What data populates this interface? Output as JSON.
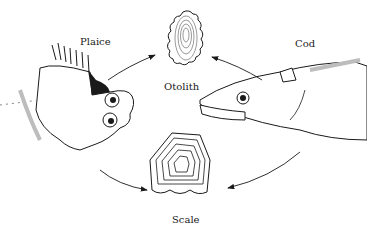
{
  "figure": {
    "labels": {
      "plaice": "Plaice",
      "otolith": "Otolith",
      "cod": "Cod",
      "scale": "Scale"
    },
    "colors": {
      "ink": "#1a1a1a",
      "background": "#ffffff",
      "shade": "#bdbdbd"
    },
    "arrows": [
      {
        "from": "plaice",
        "to": "otolith"
      },
      {
        "from": "cod",
        "to": "otolith"
      },
      {
        "from": "plaice",
        "to": "scale"
      },
      {
        "from": "cod",
        "to": "scale"
      }
    ]
  }
}
